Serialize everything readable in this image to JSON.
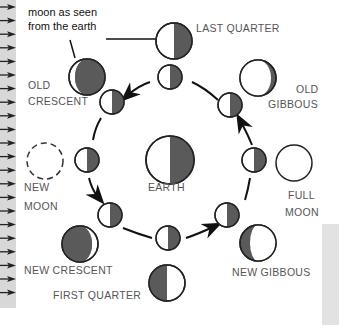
{
  "diagram": {
    "colors": {
      "shadow": "#5a5a5a",
      "lit": "#ffffff",
      "outline": "#222222",
      "sun_strip": "#d8d8d8",
      "label_text": "#555555"
    },
    "callout": {
      "text_line1": "moon as seen",
      "text_line2": "from the earth"
    },
    "center": {
      "label": "EARTH"
    },
    "phases": [
      {
        "id": "last-quarter",
        "line1": "LAST QUARTER",
        "line2": ""
      },
      {
        "id": "old-gibbous",
        "line1": "OLD",
        "line2": "GIBBOUS"
      },
      {
        "id": "full-moon",
        "line1": "FULL",
        "line2": "MOON"
      },
      {
        "id": "new-gibbous",
        "line1": "NEW GIBBOUS",
        "line2": ""
      },
      {
        "id": "first-quarter",
        "line1": "FIRST QUARTER",
        "line2": ""
      },
      {
        "id": "new-crescent",
        "line1": "NEW CRESCENT",
        "line2": ""
      },
      {
        "id": "new-moon",
        "line1": "NEW",
        "line2": "MOON"
      },
      {
        "id": "old-crescent",
        "line1": "OLD",
        "line2": "CRESCENT"
      }
    ],
    "sunlight_arrows": 22,
    "orbit_direction": "counter-clockwise"
  }
}
